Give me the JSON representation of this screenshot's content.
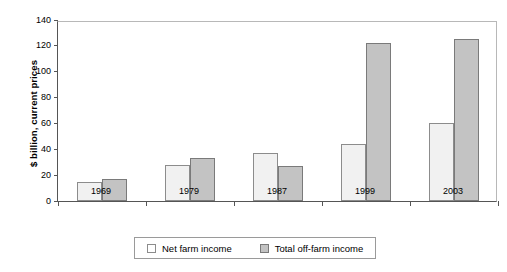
{
  "chart_data": {
    "type": "bar",
    "title": "",
    "xlabel": "",
    "ylabel": "$ billion, current prices",
    "categories": [
      "1969",
      "1979",
      "1987",
      "1999",
      "2003"
    ],
    "series": [
      {
        "name": "Net farm income",
        "values": [
          15,
          28,
          37,
          44,
          60
        ],
        "color": "#f1f1f1"
      },
      {
        "name": "Total off-farm income",
        "values": [
          17,
          33,
          27,
          122,
          125
        ],
        "color": "#c3c3c3"
      }
    ],
    "ylim": [
      0,
      140
    ],
    "ytick_labels": [
      "0",
      "20",
      "40",
      "60",
      "80",
      "100",
      "120",
      "140"
    ],
    "ytick_values": [
      0,
      20,
      40,
      60,
      80,
      100,
      120,
      140
    ],
    "grid": false,
    "legend_position": "bottom"
  },
  "legend": {
    "entries": [
      {
        "label": "Net farm income",
        "swatch": "legend-swatch-net-farm-income"
      },
      {
        "label": "Total off-farm income",
        "swatch": "legend-swatch-total-off-farm-income"
      }
    ]
  }
}
